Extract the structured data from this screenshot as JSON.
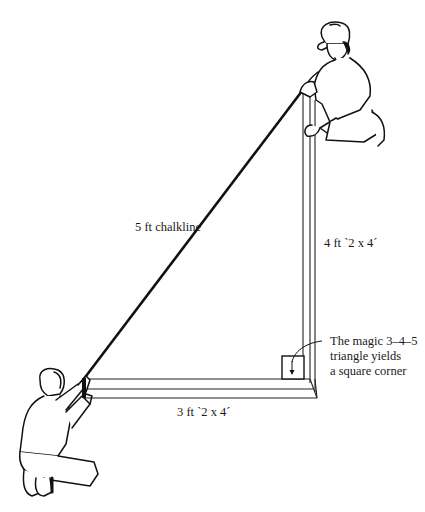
{
  "diagram": {
    "labels": {
      "hypotenuse": "5 ft chalkline",
      "vertical_board": "4 ft `2 x 4´",
      "horizontal_board": "3 ft `2 x 4´"
    },
    "callout": {
      "lines": [
        "The magic 3–4–5",
        "triangle yields",
        "a square corner"
      ]
    },
    "figures": [
      {
        "name": "worker-top-right",
        "pose": "kneeling, cap, holding chalkline at top of vertical board"
      },
      {
        "name": "worker-bottom-left",
        "pose": "kneeling, holding chalkline at end of horizontal board"
      }
    ],
    "colors": {
      "line": "#111111",
      "background": "#ffffff"
    }
  }
}
